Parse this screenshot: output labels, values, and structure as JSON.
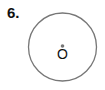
{
  "problem": {
    "number_label": "6."
  },
  "diagram": {
    "shape": "circle",
    "center_label": "O",
    "center_marked_with_dot": true,
    "stroke_color": "#777777",
    "dot_color": "#777777",
    "text_color": "#111111"
  }
}
